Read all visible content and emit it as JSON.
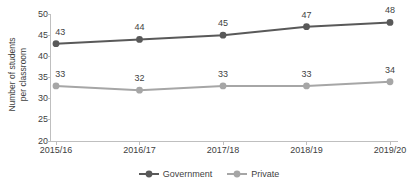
{
  "chart_data": {
    "type": "line",
    "title": "",
    "xlabel": "",
    "ylabel": "Number of students per classroom",
    "ylim": [
      20,
      50
    ],
    "yticks": [
      20,
      25,
      30,
      35,
      40,
      45,
      50
    ],
    "grid": false,
    "legend_position": "bottom-center",
    "data_labels": true,
    "categories": [
      "2015/16",
      "2016/17",
      "2017/18",
      "2018/19",
      "2019/20"
    ],
    "series": [
      {
        "name": "Government",
        "color": "#595959",
        "values": [
          43,
          44,
          45,
          47,
          48
        ]
      },
      {
        "name": "Private",
        "color": "#a6a6a6",
        "values": [
          33,
          32,
          33,
          33,
          34
        ]
      }
    ]
  },
  "axes": {
    "y_title_line1": "Number of students",
    "y_title_line2": "per classroom",
    "y_tick_labels": [
      "50",
      "45",
      "40",
      "35",
      "30",
      "25",
      "20"
    ],
    "x_tick_labels": [
      "2015/16",
      "2016/17",
      "2017/18",
      "2018/19",
      "2019/20"
    ]
  },
  "legend": {
    "items": [
      {
        "label": "Government",
        "color": "#595959"
      },
      {
        "label": "Private",
        "color": "#a6a6a6"
      }
    ]
  },
  "colors": {
    "government": "#595959",
    "private": "#a6a6a6",
    "axis": "#bfbfbf",
    "text": "#404040",
    "background": "#ffffff"
  }
}
